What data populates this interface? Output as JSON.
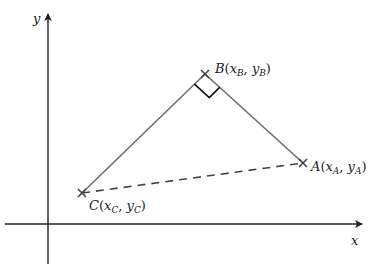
{
  "diagram": {
    "type": "coordinate-geometry",
    "axes": {
      "x_label": "x",
      "y_label": "y",
      "origin_px": [
        48,
        224
      ],
      "x_axis": {
        "from": [
          5,
          224
        ],
        "to": [
          364,
          224
        ]
      },
      "y_axis": {
        "from": [
          48,
          264
        ],
        "to": [
          48,
          12
        ]
      }
    },
    "points": {
      "A": {
        "name": "A",
        "sub": "A",
        "px": [
          303,
          163
        ]
      },
      "B": {
        "name": "B",
        "sub": "B",
        "px": [
          205,
          74
        ]
      },
      "C": {
        "name": "C",
        "sub": "C",
        "px": [
          82,
          193
        ]
      }
    },
    "segments": [
      {
        "from": "C",
        "to": "B",
        "style": "solid"
      },
      {
        "from": "B",
        "to": "A",
        "style": "solid"
      },
      {
        "from": "C",
        "to": "A",
        "style": "dashed"
      }
    ],
    "right_angle_at": "B",
    "colors": {
      "axis": "#222222",
      "triangle": "#6e6e6e",
      "marker": "#444444",
      "right_angle": "#111111",
      "dashed": "#444444"
    }
  }
}
